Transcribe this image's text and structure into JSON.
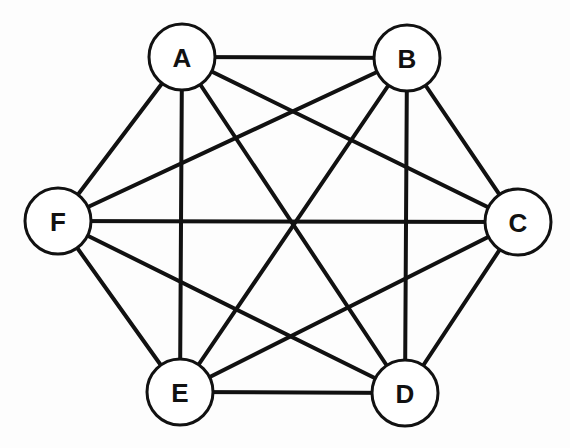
{
  "diagram": {
    "type": "complete-graph",
    "name": "K6",
    "colors": {
      "stroke": "#111111",
      "node_fill": "#ffffff",
      "background": "#fdfdfd"
    },
    "node_radius": 33,
    "nodes": [
      {
        "id": "A",
        "label": "A",
        "x": 182,
        "y": 57
      },
      {
        "id": "B",
        "label": "B",
        "x": 407,
        "y": 58
      },
      {
        "id": "C",
        "label": "C",
        "x": 518,
        "y": 222
      },
      {
        "id": "D",
        "label": "D",
        "x": 405,
        "y": 393
      },
      {
        "id": "E",
        "label": "E",
        "x": 180,
        "y": 392
      },
      {
        "id": "F",
        "label": "F",
        "x": 58,
        "y": 221
      }
    ],
    "edges": [
      [
        "A",
        "B"
      ],
      [
        "A",
        "C"
      ],
      [
        "A",
        "D"
      ],
      [
        "A",
        "E"
      ],
      [
        "A",
        "F"
      ],
      [
        "B",
        "C"
      ],
      [
        "B",
        "D"
      ],
      [
        "B",
        "E"
      ],
      [
        "B",
        "F"
      ],
      [
        "C",
        "D"
      ],
      [
        "C",
        "E"
      ],
      [
        "C",
        "F"
      ],
      [
        "D",
        "E"
      ],
      [
        "D",
        "F"
      ],
      [
        "E",
        "F"
      ]
    ]
  }
}
